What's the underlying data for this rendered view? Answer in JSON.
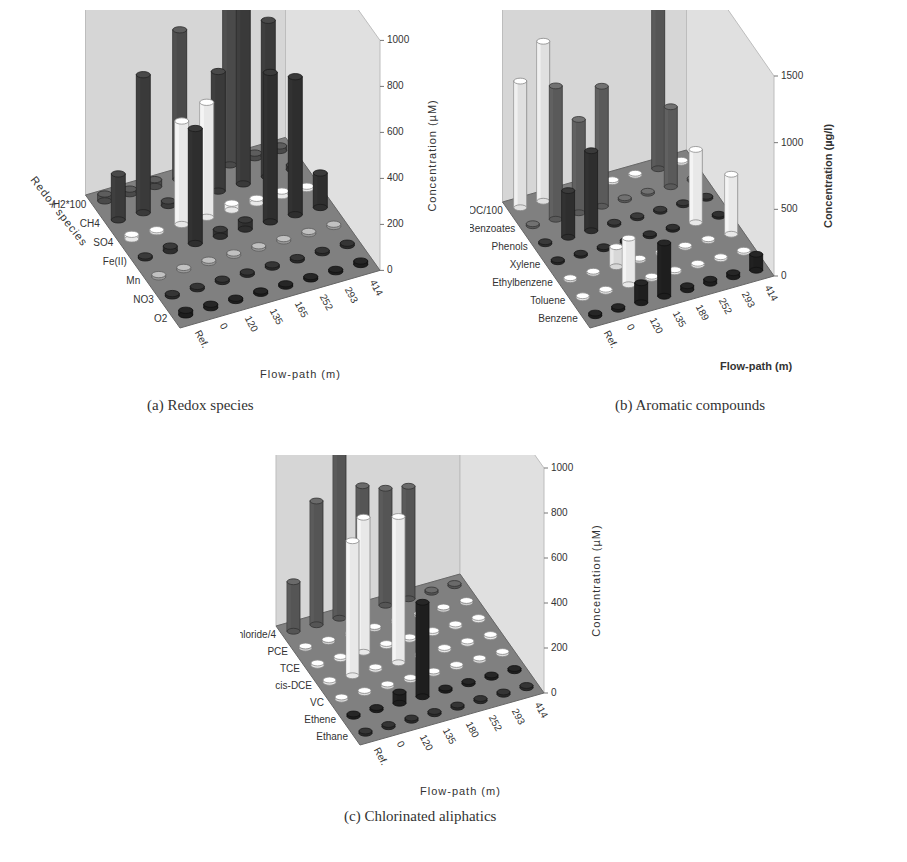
{
  "figure": {
    "captions": {
      "a": "(a) Redox species",
      "b": "(b) Aromatic compounds",
      "c": "(c) Chlorinated aliphatics"
    }
  },
  "chart_data": [
    {
      "id": "a",
      "type": "bar3d",
      "title": "(a) Redox species",
      "xlabel": "Flow-path (m)",
      "ylabel": "Redox species",
      "zlabel": "Concentration (µM)",
      "x_categories": [
        "Ref.",
        "0",
        "120",
        "135",
        "165",
        "252",
        "293",
        "414"
      ],
      "y_categories": [
        "O2",
        "NO3",
        "Mn",
        "Fe(II)",
        "SO4",
        "CH4",
        "H2*100"
      ],
      "zlim": [
        0,
        1000
      ],
      "z_ticks": [
        0,
        200,
        400,
        600,
        800,
        1000
      ],
      "series": [
        {
          "name": "O2",
          "shade": "#1e1e1e",
          "values": [
            20,
            15,
            10,
            10,
            10,
            10,
            10,
            15
          ]
        },
        {
          "name": "NO3",
          "shade": "#2a2a2a",
          "values": [
            10,
            10,
            10,
            10,
            10,
            10,
            10,
            10
          ]
        },
        {
          "name": "Mn",
          "shade": "#9a9a9a",
          "values": [
            10,
            10,
            10,
            10,
            10,
            10,
            10,
            10
          ]
        },
        {
          "name": "Fe(II)",
          "shade": "#2e2e2e",
          "values": [
            0,
            20,
            500,
            30,
            40,
            650,
            600,
            150
          ]
        },
        {
          "name": "SO4",
          "shade": "#e8e8e8",
          "values": [
            20,
            0,
            450,
            500,
            30,
            20,
            20,
            10
          ]
        },
        {
          "name": "CH4",
          "shade": "#3a3a3a",
          "values": [
            200,
            600,
            20,
            30,
            520,
            780,
            680,
            20
          ]
        },
        {
          "name": "H2*100",
          "shade": "#4a4a4a",
          "values": [
            30,
            20,
            30,
            650,
            40,
            1000,
            20,
            20
          ]
        }
      ]
    },
    {
      "id": "b",
      "type": "bar3d",
      "title": "(b) Aromatic compounds",
      "xlabel": "Flow-path (m)",
      "ylabel": "",
      "zlabel": "Concentration (µg/l)",
      "x_categories": [
        "Ref.",
        "0",
        "120",
        "135",
        "189",
        "252",
        "293",
        "414"
      ],
      "y_categories": [
        "Benzene",
        "Toluene",
        "Ethylbenzene",
        "Xylene",
        "Phenols",
        "Benzoates",
        "DOC/100"
      ],
      "zlim": [
        0,
        1500
      ],
      "z_ticks": [
        0,
        500,
        1000,
        1500
      ],
      "series": [
        {
          "name": "Benzene",
          "shade": "#1e1e1e",
          "values": [
            20,
            20,
            150,
            400,
            30,
            30,
            30,
            120
          ]
        },
        {
          "name": "Toluene",
          "shade": "#e8e8e8",
          "values": [
            10,
            10,
            350,
            10,
            10,
            10,
            10,
            10
          ]
        },
        {
          "name": "Ethylbenzene",
          "shade": "#d8d8d8",
          "values": [
            10,
            10,
            150,
            10,
            10,
            10,
            10,
            10
          ]
        },
        {
          "name": "Xylene",
          "shade": "#262626",
          "values": [
            10,
            10,
            10,
            10,
            10,
            10,
            10,
            10
          ]
        },
        {
          "name": "Phenols",
          "shade": "#2e2e2e",
          "values": [
            10,
            350,
            600,
            10,
            10,
            10,
            10,
            10
          ]
        },
        {
          "name": "Benzoates",
          "shade": "#5a5a5a",
          "values": [
            10,
            1000,
            700,
            900,
            10,
            10,
            600,
            10
          ]
        },
        {
          "name": "DOC/100",
          "shade": "#e0e0e0",
          "values": [
            950,
            1200,
            10,
            10,
            10,
            10,
            10,
            10
          ]
        }
      ],
      "extra_bars": [
        {
          "x": "293",
          "y": "DOC/100",
          "value": 1450,
          "shade": "#555555"
        },
        {
          "x": "293",
          "y": "Xylene",
          "value": 550,
          "shade": "#e8e8e8"
        },
        {
          "x": "414",
          "y": "Ethylbenzene",
          "value": 450,
          "shade": "#e8e8e8"
        }
      ]
    },
    {
      "id": "c",
      "type": "bar3d",
      "title": "(c) Chlorinated aliphatics",
      "xlabel": "Flow-path (m)",
      "ylabel": "",
      "zlabel": "Concentration (µM)",
      "x_categories": [
        "Ref.",
        "0",
        "120",
        "135",
        "180",
        "252",
        "293",
        "414"
      ],
      "y_categories": [
        "Ethane",
        "Ethene",
        "VC",
        "cis-DCE",
        "TCE",
        "PCE",
        "Chloride/4"
      ],
      "zlim": [
        0,
        1000
      ],
      "z_ticks": [
        0,
        200,
        400,
        600,
        800,
        1000
      ],
      "series": [
        {
          "name": "Ethane",
          "shade": "#2a2a2a",
          "values": [
            10,
            10,
            10,
            10,
            10,
            10,
            10,
            10
          ]
        },
        {
          "name": "Ethene",
          "shade": "#1e1e1e",
          "values": [
            10,
            10,
            50,
            420,
            10,
            10,
            10,
            10
          ]
        },
        {
          "name": "VC",
          "shade": "#dcdcdc",
          "values": [
            10,
            10,
            10,
            10,
            10,
            10,
            10,
            10
          ]
        },
        {
          "name": "cis-DCE",
          "shade": "#e8e8e8",
          "values": [
            10,
            600,
            10,
            650,
            10,
            10,
            10,
            10
          ]
        },
        {
          "name": "TCE",
          "shade": "#e8e8e8",
          "values": [
            10,
            10,
            600,
            10,
            10,
            10,
            10,
            10
          ]
        },
        {
          "name": "PCE",
          "shade": "#cfcfcf",
          "values": [
            10,
            10,
            10,
            10,
            10,
            10,
            10,
            10
          ]
        },
        {
          "name": "Chloride/4",
          "shade": "#555555",
          "values": [
            220,
            550,
            1000,
            560,
            520,
            500,
            10,
            10
          ]
        }
      ]
    }
  ]
}
